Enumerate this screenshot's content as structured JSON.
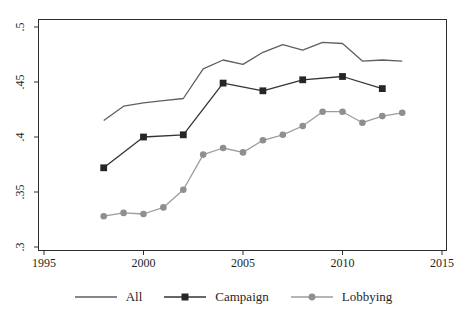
{
  "figure": {
    "background": "#ffffff",
    "axis_color": "#2e2e2e",
    "text_color": "#1f1f1f"
  },
  "chart_data": {
    "type": "line",
    "title": "",
    "xlabel": "Year",
    "ylabel": "",
    "xlim": [
      1995,
      2015
    ],
    "ylim": [
      0.3,
      0.5
    ],
    "grid": false,
    "legend_position": "bottom",
    "x_tick_labels": [
      "1995",
      "2000",
      "2005",
      "2010",
      "2015"
    ],
    "x_tick_values": [
      1995,
      2000,
      2005,
      2010,
      2015
    ],
    "y_tick_labels": [
      ".3",
      ".35",
      ".4",
      ".45",
      ".5"
    ],
    "y_tick_values": [
      0.3,
      0.35,
      0.4,
      0.45,
      0.5
    ],
    "series": [
      {
        "name": "All",
        "color": "#5f5f5f",
        "marker": "none",
        "x": [
          1998,
          1999,
          2000,
          2001,
          2002,
          2003,
          2004,
          2005,
          2006,
          2007,
          2008,
          2009,
          2010,
          2011,
          2012,
          2013
        ],
        "values": [
          0.415,
          0.428,
          0.431,
          0.433,
          0.435,
          0.462,
          0.47,
          0.466,
          0.477,
          0.484,
          0.479,
          0.486,
          0.485,
          0.469,
          0.47,
          0.469
        ]
      },
      {
        "name": "Campaign",
        "color": "#343434",
        "marker": "square",
        "marker_color": "#262626",
        "x": [
          1998,
          2000,
          2002,
          2004,
          2006,
          2008,
          2010,
          2012
        ],
        "values": [
          0.372,
          0.4,
          0.402,
          0.449,
          0.442,
          0.452,
          0.455,
          0.444
        ]
      },
      {
        "name": "Lobbying",
        "color": "#9c9c9c",
        "marker": "circle",
        "marker_color": "#8f8f8f",
        "x": [
          1998,
          1999,
          2000,
          2001,
          2002,
          2003,
          2004,
          2005,
          2006,
          2007,
          2008,
          2009,
          2010,
          2011,
          2012,
          2013
        ],
        "values": [
          0.328,
          0.331,
          0.33,
          0.336,
          0.352,
          0.384,
          0.39,
          0.386,
          0.397,
          0.402,
          0.41,
          0.423,
          0.423,
          0.413,
          0.419,
          0.422
        ]
      }
    ]
  }
}
